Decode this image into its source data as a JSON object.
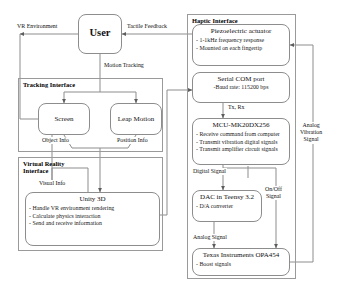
{
  "diagram": {
    "nodes": {
      "user": {
        "label": "User"
      },
      "screen": {
        "label": "Screen"
      },
      "leap_motion": {
        "label": "Leap Motion"
      },
      "unity": {
        "label": "Unity 3D",
        "bullets": [
          "- Handle VR environment rendering",
          "- Calculate physics interaction",
          "- Send and receive information"
        ]
      },
      "actuator": {
        "label": "Piezoelectric actuator",
        "bullets": [
          "- 1-1kHz frequency response",
          "- Mounted on each fingertip"
        ]
      },
      "serial": {
        "label": "Serial COM port",
        "bullets": [
          "-Baud rate: 115200 bps"
        ]
      },
      "mcu": {
        "label": "MCU-MK20DX256",
        "bullets": [
          "- Receive command from computer",
          "- Transmit vibration digital signals",
          "- Transmit amplifier circuit signals"
        ]
      },
      "dac": {
        "label": "DAC in Teensy 3.2",
        "bullets": [
          "- D/A converter"
        ]
      },
      "opa": {
        "label": "Texas  Instruments OPA454",
        "bullets": [
          "- Boost signals"
        ]
      }
    },
    "groups": {
      "tracking_interface": {
        "title": "Tracking Interface"
      },
      "vr_interface": {
        "title": "Virtual Reality\nInterface"
      },
      "haptic_interface": {
        "title": "Haptic Interface"
      }
    },
    "edge_labels": {
      "vr_environment": "VR Environment",
      "tactile_feedback": "Tactile Feedback",
      "motion_tracking": "Motion Tracking",
      "object_info": "Object Info",
      "position_info": "Position Info",
      "visual_info": "Visual Info",
      "tx_rx": "Tx, Rx",
      "digital_signal": "Digital Signal",
      "analog_signal": "Analog Signal",
      "on_off_signal": "On/Off\nSignal",
      "analog_vibration_signal": "Analog\nVibration\nSignal"
    },
    "colors": {
      "stroke": "#8d8d8d",
      "text": "#1a1a1a",
      "background": "#ffffff"
    }
  }
}
